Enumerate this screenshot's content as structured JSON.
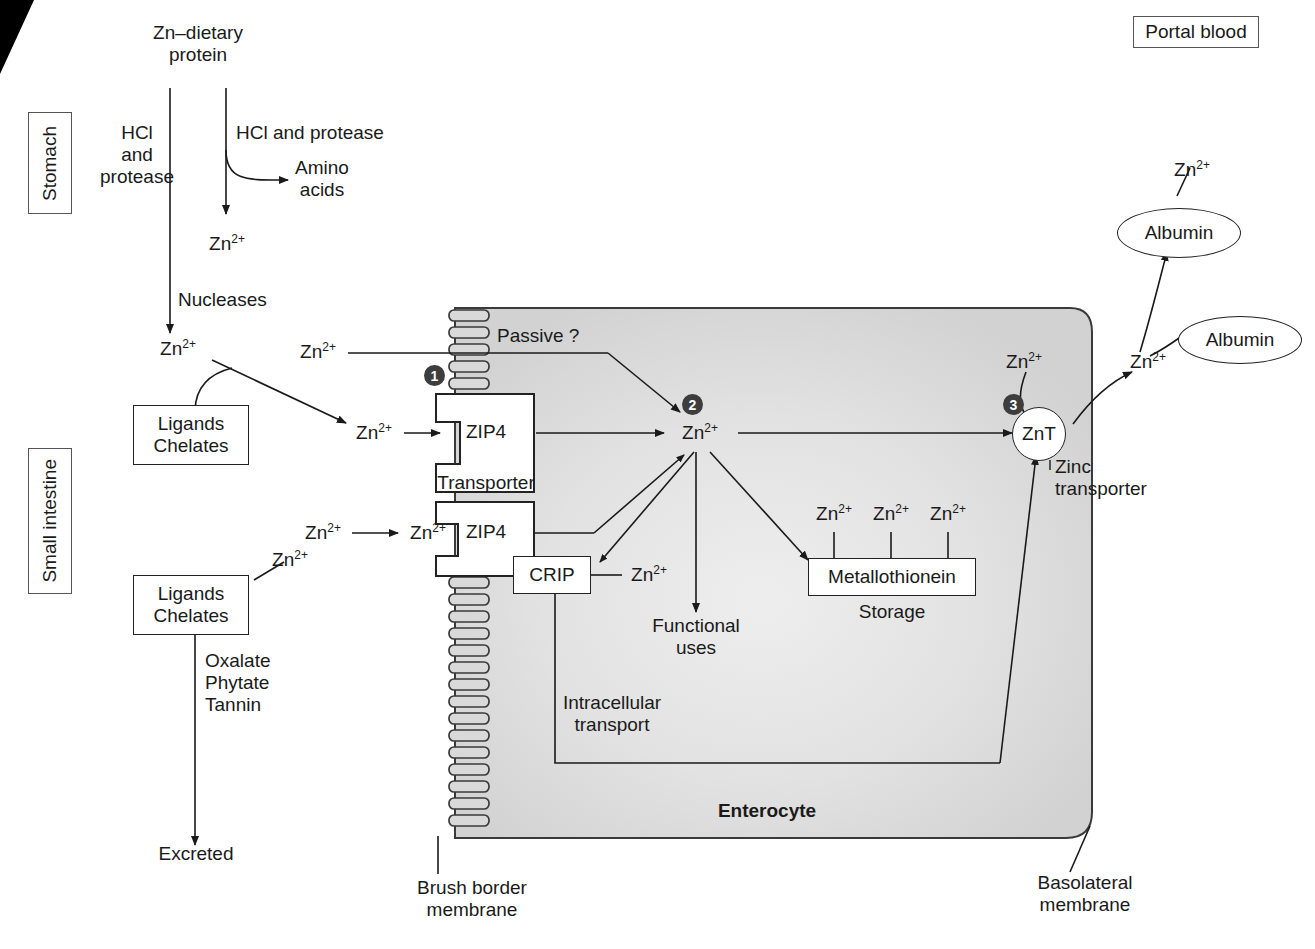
{
  "figure": {
    "cell_label": "Enterocyte",
    "cytosol_color": "#d9d9d9"
  },
  "region_labels": {
    "stomach": "Stomach",
    "small_intestine": "Small intestine",
    "portal_blood": "Portal blood"
  },
  "ions": {
    "zn": "Zn",
    "charge": "2+"
  },
  "stomach_stage": {
    "source": "Zn–dietary\nprotein",
    "left_pathway": "HCl\nand\nprotease",
    "right_pathway": "HCl and protease",
    "amino_acids": "Amino\nacids",
    "zn_released": "Zn2+",
    "nucleases": "Nucleases"
  },
  "intestine_stage": {
    "zn_lumen": "Zn2+",
    "ligands_box_1": "Ligands\nChelates",
    "ligands_box_2": "Ligands\nChelates",
    "zn_bound": "Zn2+",
    "zn_passive_lumen": "Zn2+",
    "zn_zip4_lumen": "Zn2+",
    "zn_zip4_membrane": "Zn2+",
    "zn_chelated": "Zn2+",
    "inhibitors": "Oxalate\nPhytate\nTannin",
    "excreted": "Excreted"
  },
  "transport": {
    "passive_label": "Passive ?",
    "zip4_upper": "ZIP4",
    "zip4_lower": "ZIP4",
    "transporter_label": "Transporter",
    "brush_border": "Brush border\nmembrane",
    "basolateral": "Basolateral\nmembrane",
    "znt": "ZnT",
    "znt_caption": "Zinc\ntransporter"
  },
  "cytosol": {
    "zn_pool": "Zn2+",
    "crip": "CRIP",
    "crip_zn": "Zn2+",
    "functional_uses": "Functional\nuses",
    "intracellular_transport": "Intracellular\ntransport",
    "metallothionein": "Metallothionein",
    "storage": "Storage",
    "mt_zn_1": "Zn2+",
    "mt_zn_2": "Zn2+",
    "mt_zn_3": "Zn2+",
    "zn_to_znt": "Zn2+"
  },
  "blood": {
    "albumin_bound": "Albumin",
    "albumin_free": "Albumin",
    "zn_on_albumin": "Zn2+",
    "zn_exported": "Zn2+"
  },
  "steps": {
    "one": "1",
    "two": "2",
    "three": "3"
  }
}
